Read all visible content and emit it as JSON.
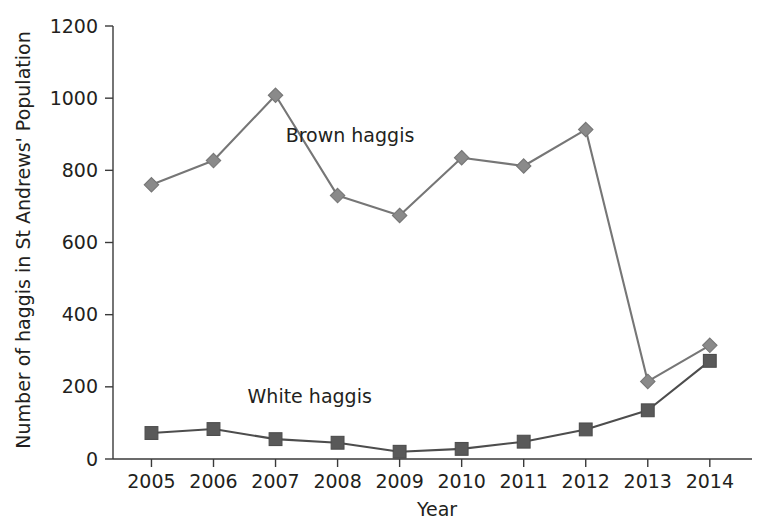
{
  "chart_data": {
    "type": "line",
    "title": "",
    "xlabel": "Year",
    "ylabel": "Number of haggis in St Andrews' Population",
    "categories": [
      "2005",
      "2006",
      "2007",
      "2008",
      "2009",
      "2010",
      "2011",
      "2012",
      "2013",
      "2014"
    ],
    "x": [
      2005,
      2006,
      2007,
      2008,
      2009,
      2010,
      2011,
      2012,
      2013,
      2014
    ],
    "xlim": [
      2004.5,
      2014.5
    ],
    "ylim": [
      0,
      1200
    ],
    "yticks": [
      0,
      200,
      400,
      600,
      800,
      1000,
      1200
    ],
    "ytick_labels": [
      "0",
      "200",
      "400",
      "600",
      "800",
      "1000",
      "1200"
    ],
    "grid": false,
    "legend_position": "inline-annotations",
    "series": [
      {
        "name": "Brown haggis",
        "marker": "diamond",
        "color": "#8a8a8a",
        "line_color": "#767676",
        "values": [
          760,
          827,
          1008,
          730,
          675,
          835,
          812,
          913,
          215,
          315
        ]
      },
      {
        "name": "White haggis",
        "marker": "square",
        "color": "#595959",
        "line_color": "#4d4d4d",
        "values": [
          72,
          83,
          55,
          45,
          20,
          28,
          48,
          82,
          135,
          272
        ]
      }
    ],
    "annotations": [
      {
        "text": "Brown haggis",
        "x": 2008.2,
        "y": 880
      },
      {
        "text": "White haggis",
        "x": 2007.55,
        "y": 155
      }
    ]
  },
  "axes": {
    "x_axis_label": "Year",
    "y_axis_label": "Number of haggis in St Andrews' Population"
  }
}
